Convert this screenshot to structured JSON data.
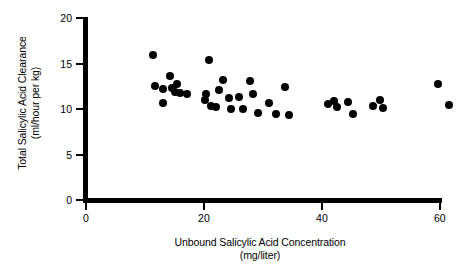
{
  "chart_data": {
    "type": "scatter",
    "title": "",
    "xlabel": "Unbound Salicylic Acid Concentration",
    "xlabel_units": "(mg/liter)",
    "ylabel": "Total Salicylic Acid Clearance",
    "ylabel_units": "(ml/hour per kg)",
    "xlim": [
      0,
      60.7
    ],
    "ylim": [
      0,
      20
    ],
    "xticks": [
      0,
      20,
      40,
      60
    ],
    "xticklabels": [
      "0",
      "20",
      "40",
      "60"
    ],
    "yticks": [
      0,
      5,
      10,
      15,
      20
    ],
    "yticklabels": [
      "0",
      "5",
      "10",
      "15",
      "20"
    ],
    "grid": false,
    "legend": null,
    "marker": "filled-circle",
    "marker_color": "#000000",
    "points": [
      {
        "x": 11.4,
        "y": 15.9
      },
      {
        "x": 11.7,
        "y": 12.5
      },
      {
        "x": 13.1,
        "y": 12.2
      },
      {
        "x": 14.2,
        "y": 13.6
      },
      {
        "x": 14.6,
        "y": 12.3
      },
      {
        "x": 15.1,
        "y": 11.9
      },
      {
        "x": 15.4,
        "y": 12.7
      },
      {
        "x": 16.0,
        "y": 11.8
      },
      {
        "x": 13.0,
        "y": 10.7
      },
      {
        "x": 17.2,
        "y": 11.6
      },
      {
        "x": 20.8,
        "y": 15.4
      },
      {
        "x": 20.4,
        "y": 11.6
      },
      {
        "x": 20.2,
        "y": 11.0
      },
      {
        "x": 21.2,
        "y": 10.3
      },
      {
        "x": 22.6,
        "y": 12.1
      },
      {
        "x": 22.1,
        "y": 10.2
      },
      {
        "x": 23.3,
        "y": 13.2
      },
      {
        "x": 24.2,
        "y": 11.2
      },
      {
        "x": 24.6,
        "y": 10.0
      },
      {
        "x": 25.9,
        "y": 11.3
      },
      {
        "x": 26.6,
        "y": 10.0
      },
      {
        "x": 27.8,
        "y": 13.1
      },
      {
        "x": 28.4,
        "y": 11.7
      },
      {
        "x": 29.2,
        "y": 9.6
      },
      {
        "x": 31.0,
        "y": 10.7
      },
      {
        "x": 32.2,
        "y": 9.4
      },
      {
        "x": 33.8,
        "y": 12.4
      },
      {
        "x": 34.4,
        "y": 9.3
      },
      {
        "x": 41.0,
        "y": 10.6
      },
      {
        "x": 42.1,
        "y": 10.9
      },
      {
        "x": 42.5,
        "y": 10.2
      },
      {
        "x": 44.5,
        "y": 10.8
      },
      {
        "x": 45.3,
        "y": 9.5
      },
      {
        "x": 48.6,
        "y": 10.3
      },
      {
        "x": 49.9,
        "y": 11.0
      },
      {
        "x": 50.4,
        "y": 10.1
      },
      {
        "x": 59.7,
        "y": 12.7
      },
      {
        "x": 61.5,
        "y": 10.4
      }
    ]
  }
}
